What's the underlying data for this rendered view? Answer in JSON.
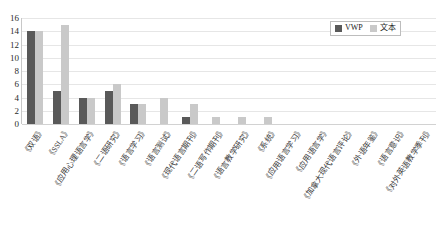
{
  "chart_data": {
    "type": "bar",
    "title": "",
    "subtitle": "",
    "xlabel": "",
    "ylabel": "",
    "ylim": [
      0,
      16
    ],
    "ytick_step": 2,
    "yticks": [
      16,
      14,
      12,
      10,
      8,
      6,
      4,
      2,
      0
    ],
    "grid": true,
    "grid_axis": "y",
    "legend_position": "top-right",
    "categories": [
      "《双语》",
      "《SSLA》",
      "《应用心理语言学》",
      "《二语研究》",
      "《语言学习》",
      "《语言测试》",
      "《现代语言期刊》",
      "《二语写作期刊》",
      "《语言教学研究》",
      "《系统》",
      "《应用语言学习》",
      "《应用语言学》",
      "《加拿大现代语言评论》",
      "《外语年鉴》",
      "《语言意识》",
      "《对外英语教学季刊》"
    ],
    "series": [
      {
        "name": "VWP",
        "color": "#595959",
        "values": [
          14,
          5,
          4,
          5,
          3,
          0,
          1,
          0,
          0,
          0,
          0,
          0,
          0,
          0,
          0,
          0
        ]
      },
      {
        "name": "文本",
        "color": "#c9c9c9",
        "values": [
          14,
          15,
          4,
          6,
          3,
          4,
          3,
          1,
          1,
          1,
          0,
          0,
          0,
          0,
          0,
          0
        ]
      }
    ]
  },
  "legend": {
    "items": [
      {
        "label": "VWP",
        "color": "#595959"
      },
      {
        "label": "文本",
        "color": "#c9c9c9"
      }
    ]
  }
}
